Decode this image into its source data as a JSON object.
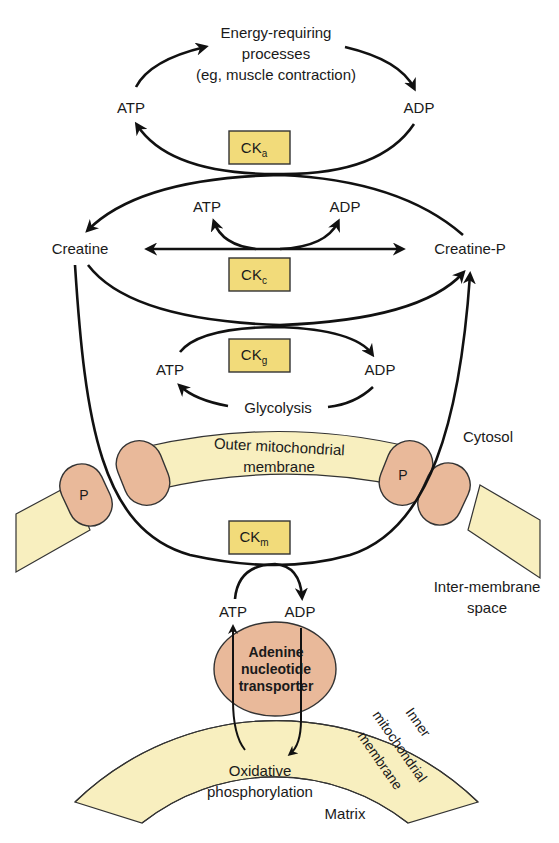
{
  "diagram": {
    "colors": {
      "enzyme_box": "#f2db7a",
      "membrane": "#f8efbf",
      "protein": "#e9b99a",
      "line": "#111111",
      "background": "#ffffff"
    },
    "top_cycle": {
      "process": [
        "Energy-requiring",
        "processes",
        "(eg, muscle contraction)"
      ],
      "atp": "ATP",
      "adp": "ADP",
      "enzyme": {
        "main": "CK",
        "sub": "a"
      }
    },
    "cytosol_reaction": {
      "left": "Creatine",
      "right": "Creatine-P",
      "atp": "ATP",
      "adp": "ADP",
      "enzyme": {
        "main": "CK",
        "sub": "c"
      }
    },
    "glycolysis_cycle": {
      "atp": "ATP",
      "adp": "ADP",
      "source": "Glycolysis",
      "enzyme": {
        "main": "CK",
        "sub": "g"
      }
    },
    "outer_membrane": {
      "label": [
        "Outer mitochondrial",
        "membrane"
      ],
      "pore": "P"
    },
    "compartments": {
      "cytosol": "Cytosol",
      "intermembrane": [
        "Inter-membrane",
        "space"
      ],
      "matrix": "Matrix"
    },
    "mito_cycle": {
      "atp": "ATP",
      "adp": "ADP",
      "enzyme": {
        "main": "CK",
        "sub": "m"
      }
    },
    "transporter": [
      "Adenine",
      "nucleotide",
      "transporter"
    ],
    "inner_membrane": [
      "Inner",
      "mitochondrial",
      "membrane"
    ],
    "oxphos": [
      "Oxidative",
      "phosphorylation"
    ]
  }
}
